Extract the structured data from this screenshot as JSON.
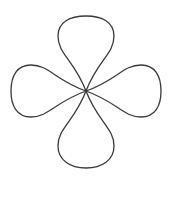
{
  "figure": {
    "title": "Four Petal Rose Curve",
    "background_color": "#ffffff",
    "stroke_color": "#3a3a3a",
    "stroke_width": 1.3,
    "fill": "none",
    "canvas": {
      "width": 171,
      "height": 201
    },
    "center": {
      "x": 86,
      "y": 91
    },
    "petal_count": 4,
    "petals": [
      {
        "name": "top-petal",
        "direction": "up",
        "angle_deg": 90,
        "tip": {
          "x": 86,
          "y": 16
        },
        "max_width": 56,
        "length": 75
      },
      {
        "name": "right-petal",
        "direction": "right",
        "angle_deg": 0,
        "tip": {
          "x": 157,
          "y": 91
        },
        "max_width": 52,
        "length": 71
      },
      {
        "name": "bottom-petal",
        "direction": "down",
        "angle_deg": 270,
        "tip": {
          "x": 86,
          "y": 168
        },
        "max_width": 56,
        "length": 77
      },
      {
        "name": "left-petal",
        "direction": "left",
        "angle_deg": 180,
        "tip": {
          "x": 13,
          "y": 91
        },
        "max_width": 52,
        "length": 73
      }
    ],
    "paths": {
      "top_petal_d": "M 86 91 C 74 60 58 54 58 36 C 58 22 70 16 86 16 C 102 16 114 22 114 36 C 114 54 98 60 86 91 Z",
      "right_petal_d": "M 86 91 C 117 80 123 65 141 65 C 155 65 161 76 161 91 C 161 106 155 117 141 117 C 123 117 117 102 86 91 Z",
      "bottom_petal_d": "M 86 91 C 74 122 58 128 58 146 C 58 160 70 168 86 168 C 102 168 114 160 114 146 C 114 128 98 122 86 91 Z",
      "left_petal_d": "M 86 91 C 55 80 49 65 31 65 C 17 65 11 76 11 91 C 11 106 17 117 31 117 C 49 117 55 102 86 91 Z"
    }
  }
}
